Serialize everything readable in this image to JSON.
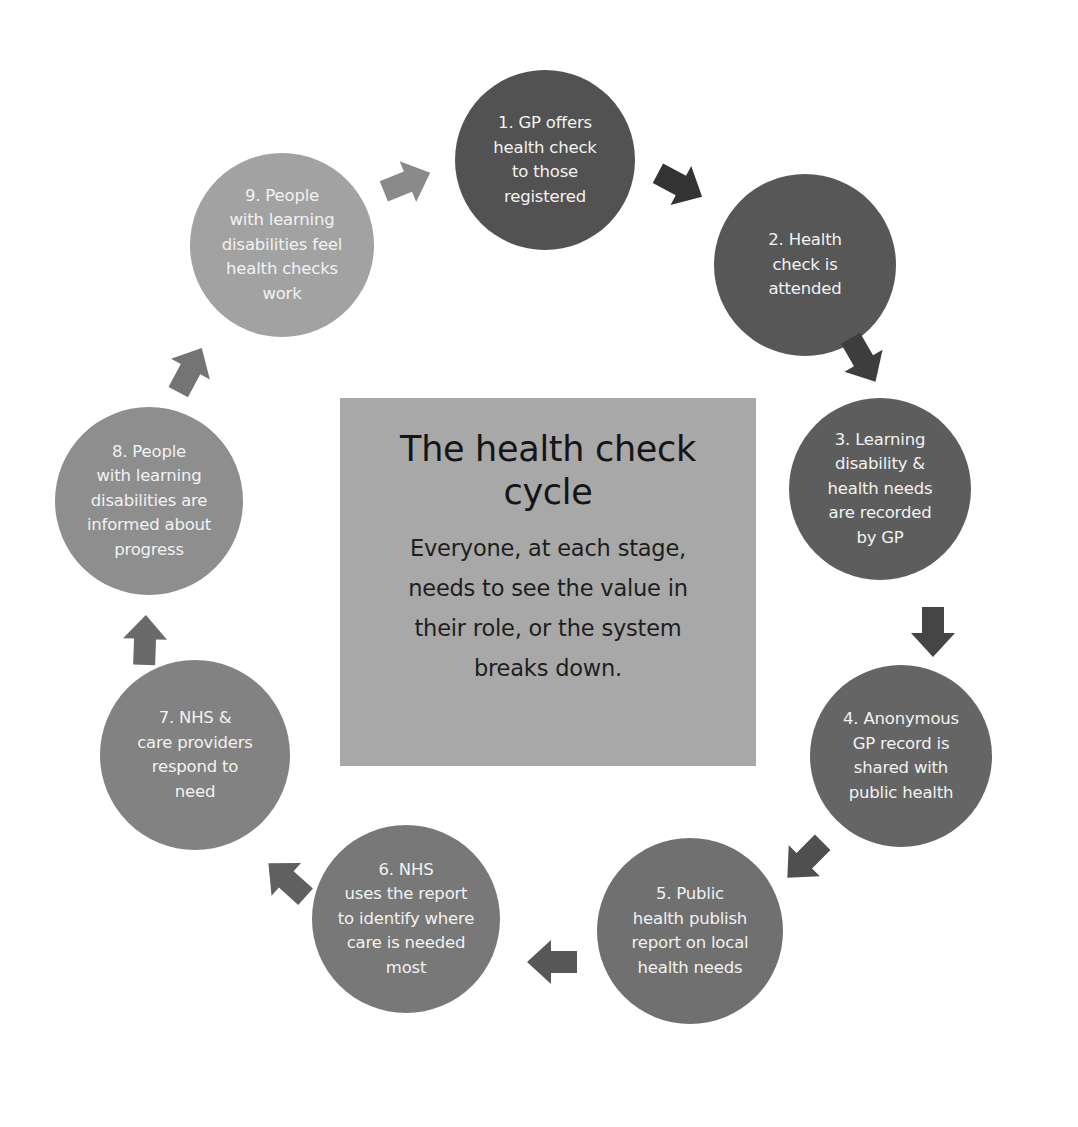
{
  "diagram": {
    "type": "cycle",
    "title": "The health check\ncycle",
    "subtitle": "Everyone, at each stage,\nneeds to see the value in\ntheir role, or the system\nbreaks down.",
    "center_box_color": "#a8a8a8",
    "steps": [
      {
        "id": 1,
        "label": "1. GP offers\nhealth check\nto those\nregistered",
        "color": "#525252"
      },
      {
        "id": 2,
        "label": "2. Health\ncheck is\nattended",
        "color": "#575757"
      },
      {
        "id": 3,
        "label": "3. Learning\ndisability &\nhealth needs\nare recorded\nby GP",
        "color": "#5d5d5d"
      },
      {
        "id": 4,
        "label": "4. Anonymous\nGP record is\nshared with\npublic health",
        "color": "#656565"
      },
      {
        "id": 5,
        "label": "5. Public\nhealth publish\nreport on local\nhealth needs",
        "color": "#707070"
      },
      {
        "id": 6,
        "label": "6. NHS\nuses the report\nto identify where\ncare is needed\nmost",
        "color": "#787878"
      },
      {
        "id": 7,
        "label": "7. NHS &\ncare providers\nrespond to\nneed",
        "color": "#828282"
      },
      {
        "id": 8,
        "label": "8. People\nwith learning\ndisabilities are\ninformed about\nprogress",
        "color": "#8e8e8e"
      },
      {
        "id": 9,
        "label": "9. People\nwith learning\ndisabilities feel\nhealth checks\nwork",
        "color": "#a2a2a2"
      }
    ],
    "arrows": [
      {
        "from": 1,
        "to": 2,
        "icon": "arrow-right-down-icon",
        "color": "#333333"
      },
      {
        "from": 2,
        "to": 3,
        "icon": "arrow-down-right-icon",
        "color": "#3d3d3d"
      },
      {
        "from": 3,
        "to": 4,
        "icon": "arrow-down-icon",
        "color": "#454545"
      },
      {
        "from": 4,
        "to": 5,
        "icon": "arrow-down-left-icon",
        "color": "#4f4f4f"
      },
      {
        "from": 5,
        "to": 6,
        "icon": "arrow-left-icon",
        "color": "#585858"
      },
      {
        "from": 6,
        "to": 7,
        "icon": "arrow-up-left-icon",
        "color": "#606060"
      },
      {
        "from": 7,
        "to": 8,
        "icon": "arrow-up-icon",
        "color": "#6a6a6a"
      },
      {
        "from": 8,
        "to": 9,
        "icon": "arrow-up-right-icon",
        "color": "#747474"
      },
      {
        "from": 9,
        "to": 1,
        "icon": "arrow-right-icon",
        "color": "#8a8a8a"
      }
    ]
  }
}
